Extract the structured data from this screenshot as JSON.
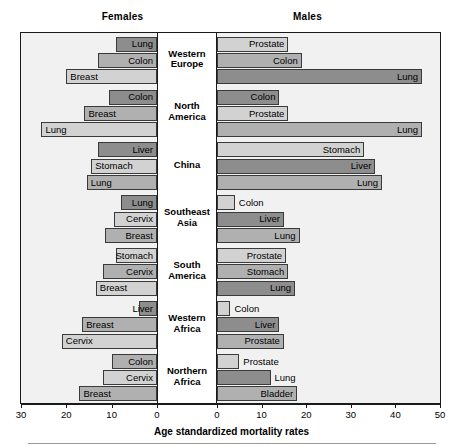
{
  "header": {
    "females_label": "Females",
    "males_label": "Males"
  },
  "axis": {
    "title": "Age standardized mortality rates",
    "female_ticks": [
      30,
      20,
      10,
      0
    ],
    "male_ticks": [
      0,
      10,
      20,
      30,
      40,
      50
    ],
    "female_max": 30,
    "male_max": 50
  },
  "colors": {
    "bar_light": "#d2d2d2",
    "bar_medium": "#b0b0b0",
    "bar_dark": "#8d8d8d",
    "panel_bg": "#f1f1f1",
    "frame": "#1a1a1a",
    "row_divider": "#bdbdbd"
  },
  "chart_data": {
    "type": "bar",
    "title": "",
    "xlabel": "Age standardized mortality rates",
    "ylabel": "",
    "orientation": "horizontal",
    "layout": "back-to-back population pyramid; females plotted leftwards (axis 30 to 0), males plotted rightwards (axis 0 to 50)",
    "grid": false,
    "legend": "none (bars labelled in place)",
    "female_xlim": [
      30,
      0
    ],
    "male_xlim": [
      0,
      50
    ],
    "categories": [
      "Western Europe",
      "North America",
      "China",
      "Southeast Asia",
      "South America",
      "Western Africa",
      "Northern Africa"
    ],
    "regions": [
      {
        "region": "Western Europe",
        "region_label": "Western\nEurope",
        "females": [
          {
            "cancer": "Lung",
            "value": 9.0,
            "shade": "bar_dark"
          },
          {
            "cancer": "Colon",
            "value": 13.0,
            "shade": "bar_medium"
          },
          {
            "cancer": "Breast",
            "value": 20.0,
            "shade": "bar_light"
          }
        ],
        "males": [
          {
            "cancer": "Prostate",
            "value": 16.0,
            "shade": "bar_light"
          },
          {
            "cancer": "Colon",
            "value": 19.0,
            "shade": "bar_medium"
          },
          {
            "cancer": "Lung",
            "value": 46.0,
            "shade": "bar_dark"
          }
        ]
      },
      {
        "region": "North America",
        "region_label": "North\nAmerica",
        "females": [
          {
            "cancer": "Colon",
            "value": 10.5,
            "shade": "bar_dark"
          },
          {
            "cancer": "Breast",
            "value": 16.0,
            "shade": "bar_medium"
          },
          {
            "cancer": "Lung",
            "value": 25.5,
            "shade": "bar_light"
          }
        ],
        "males": [
          {
            "cancer": "Colon",
            "value": 14.0,
            "shade": "bar_dark"
          },
          {
            "cancer": "Prostate",
            "value": 16.0,
            "shade": "bar_light"
          },
          {
            "cancer": "Lung",
            "value": 46.0,
            "shade": "bar_medium"
          }
        ]
      },
      {
        "region": "China",
        "region_label": "China",
        "females": [
          {
            "cancer": "Liver",
            "value": 13.0,
            "shade": "bar_dark"
          },
          {
            "cancer": "Stomach",
            "value": 14.5,
            "shade": "bar_light"
          },
          {
            "cancer": "Lung",
            "value": 15.5,
            "shade": "bar_medium"
          }
        ],
        "males": [
          {
            "cancer": "Stomach",
            "value": 33.0,
            "shade": "bar_light"
          },
          {
            "cancer": "Liver",
            "value": 35.5,
            "shade": "bar_dark"
          },
          {
            "cancer": "Lung",
            "value": 37.0,
            "shade": "bar_medium"
          }
        ]
      },
      {
        "region": "Southeast Asia",
        "region_label": "Southeast\nAsia",
        "females": [
          {
            "cancer": "Lung",
            "value": 8.0,
            "shade": "bar_dark"
          },
          {
            "cancer": "Cervix",
            "value": 9.5,
            "shade": "bar_light"
          },
          {
            "cancer": "Breast",
            "value": 11.5,
            "shade": "bar_medium"
          }
        ],
        "males": [
          {
            "cancer": "Colon",
            "value": 4.0,
            "shade": "bar_light"
          },
          {
            "cancer": "Liver",
            "value": 15.0,
            "shade": "bar_dark"
          },
          {
            "cancer": "Lung",
            "value": 18.5,
            "shade": "bar_medium"
          }
        ]
      },
      {
        "region": "South America",
        "region_label": "South\nAmerica",
        "females": [
          {
            "cancer": "Stomach",
            "value": 9.0,
            "shade": "bar_light"
          },
          {
            "cancer": "Cervix",
            "value": 12.0,
            "shade": "bar_medium"
          },
          {
            "cancer": "Breast",
            "value": 13.5,
            "shade": "bar_light"
          }
        ],
        "males": [
          {
            "cancer": "Prostate",
            "value": 15.5,
            "shade": "bar_light"
          },
          {
            "cancer": "Stomach",
            "value": 16.0,
            "shade": "bar_medium"
          },
          {
            "cancer": "Lung",
            "value": 17.5,
            "shade": "bar_dark"
          }
        ]
      },
      {
        "region": "Western Africa",
        "region_label": "Western\nAfrica",
        "females": [
          {
            "cancer": "Liver",
            "value": 4.0,
            "shade": "bar_dark"
          },
          {
            "cancer": "Breast",
            "value": 16.5,
            "shade": "bar_medium"
          },
          {
            "cancer": "Cervix",
            "value": 21.0,
            "shade": "bar_light"
          }
        ],
        "males": [
          {
            "cancer": "Colon",
            "value": 3.0,
            "shade": "bar_light"
          },
          {
            "cancer": "Liver",
            "value": 14.0,
            "shade": "bar_dark"
          },
          {
            "cancer": "Prostate",
            "value": 15.0,
            "shade": "bar_medium"
          }
        ]
      },
      {
        "region": "Northern Africa",
        "region_label": "Northern\nAfrica",
        "females": [
          {
            "cancer": "Colon",
            "value": 9.9,
            "shade": "bar_medium"
          },
          {
            "cancer": "Cervix",
            "value": 11.9,
            "shade": "bar_light"
          },
          {
            "cancer": "Breast",
            "value": 17.1,
            "shade": "bar_medium"
          }
        ],
        "males": [
          {
            "cancer": "Prostate",
            "value": 5.0,
            "shade": "bar_light"
          },
          {
            "cancer": "Lung",
            "value": 12.0,
            "shade": "bar_dark"
          },
          {
            "cancer": "Bladder",
            "value": 18.0,
            "shade": "bar_medium"
          }
        ]
      }
    ]
  }
}
